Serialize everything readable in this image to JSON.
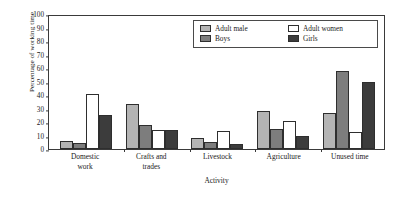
{
  "chart_data": {
    "type": "bar",
    "title": "",
    "subtitle": "",
    "xlabel": "Activity",
    "ylabel": "Percentage of working time",
    "ylim": [
      0,
      100
    ],
    "ytick_step": 10,
    "yticks": [
      100,
      90,
      80,
      70,
      60,
      50,
      40,
      30,
      20,
      10,
      0
    ],
    "grid": false,
    "legend_position": "top-right",
    "categories": [
      "Domestic work",
      "Crafts and trades",
      "Livestock",
      "Agriculture",
      "Unused time"
    ],
    "category_lines": [
      [
        "Domestic",
        "work"
      ],
      [
        "Crafts and",
        "trades"
      ],
      [
        "Livestock"
      ],
      [
        "Agriculture"
      ],
      [
        "Unused time"
      ]
    ],
    "series": [
      {
        "name": "Adult male",
        "color": "#b4b4b4",
        "values": [
          6,
          33,
          8,
          28,
          27
        ]
      },
      {
        "name": "Boys",
        "color": "#7d7d7d",
        "values": [
          4.5,
          17.5,
          5.5,
          15,
          57.5
        ]
      },
      {
        "name": "Adult women",
        "color": "#ffffff",
        "values": [
          40.5,
          14,
          13.5,
          20.5,
          12.5
        ]
      },
      {
        "name": "Girls",
        "color": "#3c3c3c",
        "values": [
          25.5,
          14,
          3.5,
          9.5,
          49.5
        ]
      }
    ]
  },
  "legend": {
    "items": [
      {
        "label": "Adult male",
        "swatch": "#b4b4b4"
      },
      {
        "label": "Adult women",
        "swatch": "#ffffff"
      },
      {
        "label": "Boys",
        "swatch": "#7d7d7d"
      },
      {
        "label": "Girls",
        "swatch": "#3c3c3c"
      }
    ]
  }
}
